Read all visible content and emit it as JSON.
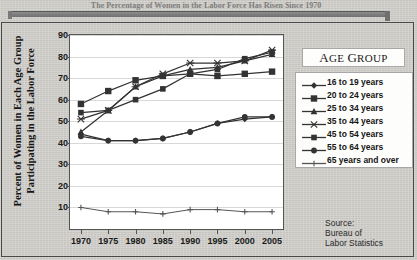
{
  "caption": {
    "headline": "The Percentage of Women in the Labor Force Has Risen Since 1970"
  },
  "chart_data": {
    "type": "line",
    "title": "",
    "xlabel": "",
    "ylabel": "Percent of Women in Each Age Group Participating in the Labor Force",
    "x": [
      1970,
      1975,
      1980,
      1985,
      1990,
      1995,
      2000,
      2005
    ],
    "xtick_labels": [
      "1970",
      "1975",
      "1980",
      "1985",
      "1990",
      "1995",
      "2000",
      "2005"
    ],
    "ytick_labels": [
      "10",
      "20",
      "30",
      "40",
      "50",
      "60",
      "70",
      "80",
      "90"
    ],
    "ylim": [
      0,
      90
    ],
    "xlim": [
      1968,
      2007
    ],
    "grid": true,
    "legend_position": "right",
    "legend_title": "Age Group",
    "series": [
      {
        "name": "16 to 19 years",
        "marker": "diamond",
        "color": "#333333",
        "values": [
          44,
          41,
          41,
          42,
          45,
          49,
          51,
          52
        ]
      },
      {
        "name": "20 to 24 years",
        "marker": "square",
        "color": "#333333",
        "values": [
          58,
          64,
          69,
          71,
          72,
          71,
          72,
          73
        ]
      },
      {
        "name": "25 to 34 years",
        "marker": "triangle",
        "color": "#333333",
        "values": [
          45,
          55,
          66,
          71,
          74,
          75,
          78,
          81
        ]
      },
      {
        "name": "35 to 44 years",
        "marker": "star",
        "color": "#333333",
        "values": [
          51,
          55,
          66,
          72,
          77,
          77,
          78,
          83
        ]
      },
      {
        "name": "45 to 54 years",
        "marker": "square-small",
        "color": "#333333",
        "values": [
          54,
          55,
          60,
          65,
          72,
          74,
          79,
          82
        ]
      },
      {
        "name": "55 to 64 years",
        "marker": "circle",
        "color": "#333333",
        "values": [
          43,
          41,
          41,
          42,
          45,
          49,
          52,
          52
        ]
      },
      {
        "name": "65 years and over",
        "marker": "plus",
        "color": "#555555",
        "values": [
          10,
          8,
          8,
          7,
          9,
          9,
          8,
          8
        ]
      }
    ],
    "source": {
      "line1": "Source:",
      "line2": "Bureau of",
      "line3": "Labor Statistics"
    }
  }
}
